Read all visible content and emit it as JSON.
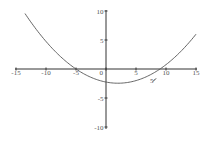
{
  "chart_data": {
    "type": "line",
    "title": "",
    "xlabel": "",
    "ylabel": "",
    "xlim": [
      -15,
      15
    ],
    "ylim": [
      -10,
      10
    ],
    "grid": false,
    "legend": null,
    "x_ticks": [
      -15,
      -10,
      -5,
      0,
      5,
      10,
      15
    ],
    "x_tick_labels": [
      "-15",
      "-10",
      "-5",
      "0",
      "5",
      "10",
      "15"
    ],
    "y_ticks": [
      10,
      5,
      -5,
      -10
    ],
    "y_tick_labels": [
      "10",
      "5",
      "-5",
      "-10"
    ],
    "series": [
      {
        "name": "parabola",
        "description": "upward-opening parabola, approx y = (x+5)(x-9)/20",
        "x": [
          -13.5,
          -10,
          -5,
          0,
          2,
          5,
          9,
          12,
          15
        ],
        "y": [
          9.8,
          5.6,
          0,
          -2.25,
          -2.45,
          -2.0,
          0,
          3.4,
          6.0
        ]
      }
    ],
    "annotations": [
      {
        "text": "5",
        "x": 7.5,
        "y": -1.8,
        "note": "small tick mark on curve"
      }
    ],
    "colors": {
      "axis": "#333333",
      "curve": "#555555",
      "labels": "#555555"
    }
  }
}
